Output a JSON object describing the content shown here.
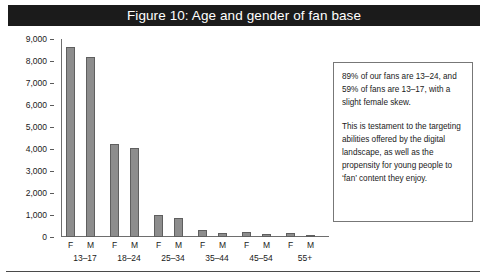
{
  "figure": {
    "title": "Figure 10: Age and gender of fan base"
  },
  "chart_data": {
    "type": "bar",
    "title": "Figure 10: Age and gender of fan base",
    "xlabel": "",
    "ylabel": "",
    "ylim": [
      0,
      9000
    ],
    "grid": false,
    "legend": "none",
    "y_ticks": [
      "0",
      "1,000",
      "2,000",
      "3,000",
      "4,000",
      "5,000",
      "6,000",
      "7,000",
      "8,000",
      "9,000"
    ],
    "age_groups": [
      "13–17",
      "18–24",
      "25–34",
      "35–44",
      "45–54",
      "55+"
    ],
    "genders": [
      "F",
      "M"
    ],
    "categories": [
      "F 13–17",
      "M 13–17",
      "F 18–24",
      "M 18–24",
      "F 25–34",
      "M 25–34",
      "F 35–44",
      "M 35–44",
      "F 45–54",
      "M 45–54",
      "F 55+",
      "M 55+"
    ],
    "values": [
      8650,
      8170,
      4250,
      4050,
      1000,
      870,
      320,
      180,
      220,
      130,
      180,
      110
    ],
    "bar_color": "#8d8d8d",
    "bar_edge_color": "#5f5f5f"
  },
  "callout": {
    "paragraphs": [
      "89% of our fans are 13–24, and 59% of fans are 13–17, with a slight female skew.",
      "This is testament to the targeting abilities offered by the digital landscape, as well as the propensity for young people to ‘fan’ content they enjoy."
    ]
  }
}
